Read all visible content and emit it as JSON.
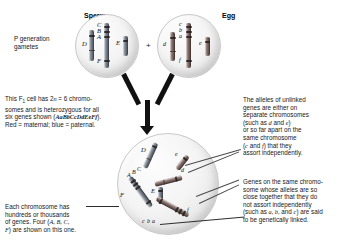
{
  "figure": {
    "type": "genetics-diagram"
  },
  "headers": {
    "sperm": "Sperm",
    "egg": "Egg",
    "plus": "+"
  },
  "labels": {
    "p_generation": "P generation\ngametes",
    "p_generation_line1": "P generation",
    "p_generation_line2": "gametes"
  },
  "sperm_cell": {
    "name": "sperm-gamete",
    "gene_labels": [
      "D",
      "C",
      "B",
      "A",
      "F",
      "E"
    ],
    "chromosomes": [
      {
        "id": "sperm-chr-D",
        "genes": [
          "D"
        ],
        "origin": "paternal"
      },
      {
        "id": "sperm-chr-ABCF",
        "genes": [
          "C",
          "B",
          "A",
          "F"
        ],
        "origin": "paternal"
      },
      {
        "id": "sperm-chr-E",
        "genes": [
          "E"
        ],
        "origin": "paternal"
      }
    ]
  },
  "egg_cell": {
    "name": "egg-gamete",
    "gene_labels": [
      "d",
      "c",
      "b",
      "a",
      "f",
      "e"
    ],
    "chromosomes": [
      {
        "id": "egg-chr-d",
        "genes": [
          "d"
        ],
        "origin": "maternal"
      },
      {
        "id": "egg-chr-abcf",
        "genes": [
          "c",
          "b",
          "a",
          "f"
        ],
        "origin": "maternal"
      },
      {
        "id": "egg-chr-e",
        "genes": [
          "e"
        ],
        "origin": "maternal"
      }
    ]
  },
  "f1_cell": {
    "name": "f1-zygote",
    "gene_labels": [
      "D",
      "e",
      "A",
      "B",
      "C",
      "d",
      "F",
      "E",
      "c",
      "b",
      "a",
      "f"
    ],
    "chromosome_count": 6
  },
  "callouts": {
    "f1_description": {
      "lines": [
        "This F₁ cell has 2n = 6 chromo-",
        "somes and is heterozygous for all",
        "six genes shown (AaBbCcDdEeFf).",
        "Red = maternal; blue = paternal."
      ],
      "genotype": "AaBbCcDdEeFf",
      "line1_a": "This F",
      "line1_sub": "1",
      "line1_b": " cell has 2",
      "line1_n": "n",
      "line1_c": " = 6 chromo-",
      "line2": "somes and is heterozygous for all",
      "line3_a": "six genes shown (",
      "line3_b": ").",
      "line4": "Red = maternal; blue = paternal."
    },
    "each_chromosome": {
      "line1": "Each chromosome has",
      "line2": "hundreds or thousands",
      "line3_a": "of genes. Four (",
      "line3_genes": "A, B, C,",
      "line4_genes": "F",
      "line4_b": ") are shown on this one."
    },
    "unlinked_genes": {
      "line1": "The alleles of unlinked",
      "line2": "genes are either on",
      "line3": "separate chromosomes",
      "line4_a": "(such as ",
      "line4_g1": "d",
      "line4_b": " and ",
      "line4_g2": "e",
      "line4_c": ")",
      "line5": "or so far apart on the",
      "line6": "same chromosome",
      "line7_a": "(",
      "line7_g1": "c",
      "line7_b": " and ",
      "line7_g2": "f",
      "line7_c": ") that they",
      "line8": "assort independently."
    },
    "linked_genes": {
      "line1": "Genes on the same chromo-",
      "line2": "some whose alleles are so",
      "line3": "close together that they do",
      "line4": "not assort independently",
      "line5_a": "(such as ",
      "line5_g": "a, b,",
      "line5_b": " and ",
      "line5_g2": "c",
      "line5_c": ") are said",
      "line6": "to be genetically linked."
    }
  },
  "colors": {
    "maternal": "#6d5854",
    "paternal": "#636b76",
    "cell_fill": "#f1f1f1",
    "cell_stroke": "#c9c9c9",
    "text": "#171717",
    "arrow": "#111111",
    "leader": "#4a4a4a"
  }
}
